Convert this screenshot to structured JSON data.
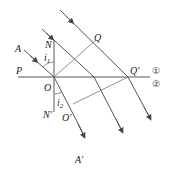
{
  "diagram": {
    "points": {
      "A": "A",
      "A_prime": "A′",
      "N": "N",
      "N_prime": "N′",
      "O": "O",
      "O_prime": "O′",
      "P": "P",
      "Q": "Q",
      "Q_prime": "Q′"
    },
    "angles": {
      "incidence": "i",
      "incidence_sub": "1",
      "refraction": "i",
      "refraction_sub": "2"
    },
    "media": {
      "upper": "①",
      "lower": "②"
    },
    "colors": {
      "line": "#555555",
      "text": "#222222"
    }
  }
}
